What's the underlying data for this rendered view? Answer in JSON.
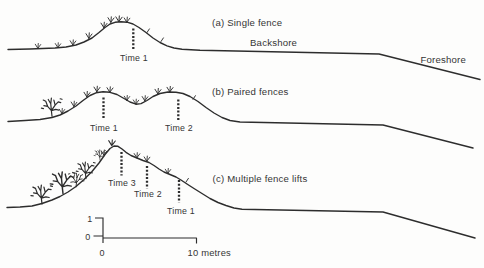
{
  "colors": {
    "background": "#fdfdfc",
    "ink": "#2d2d2d",
    "text": "#353535"
  },
  "panels": {
    "a": {
      "label": "(a) Single fence",
      "backshore": "Backshore",
      "foreshore": "Foreshore",
      "time1": "Time 1"
    },
    "b": {
      "label": "(b) Paired fences",
      "time1": "Time 1",
      "time2": "Time 2"
    },
    "c": {
      "label": "(c) Multiple fence lifts",
      "time3": "Time 3",
      "time2": "Time 2",
      "time1": "Time 1"
    }
  },
  "scale_bar": {
    "vertical_max": "1",
    "vertical_min": "0",
    "horizontal_min": "0",
    "horizontal_max": "10 metres"
  }
}
